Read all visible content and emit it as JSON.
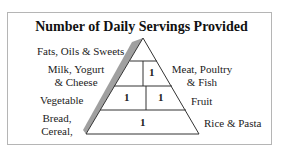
{
  "title": "Number of Daily Servings Provided",
  "left_labels": {
    "fats": "Fats, Oils & Sweets",
    "milk_line1": "Milk, Yogurt",
    "milk_line2": "& Cheese",
    "vegetable": "Vegetable",
    "bread_line1": "Bread,",
    "bread_line2": "Cereal,"
  },
  "right_labels": {
    "meat_line1": "Meat, Poultry",
    "meat_line2": "& Fish",
    "fruit": "Fruit",
    "rice": "Rice & Pasta"
  },
  "servings": {
    "milk": "",
    "meat": "1",
    "vegetable": "1",
    "fruit": "1",
    "bread_rice": "1"
  },
  "colors": {
    "lines": "#333333",
    "shadow": "#9a9a9a",
    "border": "#b5b5b5"
  }
}
